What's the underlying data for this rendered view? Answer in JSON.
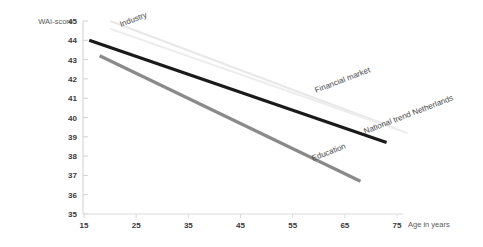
{
  "chart_data": {
    "type": "line",
    "title": "",
    "xlabel": "Age in years",
    "ylabel": "WAI-score",
    "xlim": [
      15,
      75
    ],
    "ylim": [
      35,
      45
    ],
    "grid": false,
    "legend_position": "inline-labels",
    "xticks": [
      "15",
      "25",
      "35",
      "45",
      "55",
      "65",
      "75"
    ],
    "xtick_values": [
      15,
      25,
      35,
      45,
      55,
      65,
      75
    ],
    "yticks": [
      "35",
      "36",
      "37",
      "38",
      "39",
      "40",
      "41",
      "42",
      "43",
      "44",
      "45"
    ],
    "ytick_values": [
      35,
      36,
      37,
      38,
      39,
      40,
      41,
      42,
      43,
      44,
      45
    ],
    "series": [
      {
        "name": "Industry",
        "color": "#e8e8e8",
        "width": 2.2,
        "x": [
          20,
          75
        ],
        "values": [
          45.0,
          39.4
        ]
      },
      {
        "name": "Financial market",
        "color": "#ededed",
        "width": 2.2,
        "x": [
          20,
          77
        ],
        "values": [
          44.6,
          39.2
        ]
      },
      {
        "name": "National trend Netherlands",
        "color": "#1a1a1a",
        "width": 3.2,
        "x": [
          16,
          73
        ],
        "values": [
          44.0,
          38.7
        ]
      },
      {
        "name": "Education",
        "color": "#8a8a8a",
        "width": 3.2,
        "x": [
          18,
          68
        ],
        "values": [
          43.2,
          36.7
        ]
      }
    ],
    "annotations": [
      {
        "text": "Industry",
        "x": 121,
        "y": 27,
        "rotate": -21
      },
      {
        "text": "Financial market",
        "x": 316,
        "y": 93,
        "rotate": -21
      },
      {
        "text": "National trend Netherlands",
        "x": 365,
        "y": 134,
        "rotate": -21
      },
      {
        "text": "Education",
        "x": 313,
        "y": 161,
        "rotate": -21
      }
    ]
  },
  "axes": {
    "y_axis_title": "WAI-score",
    "x_axis_title": "Age in years"
  }
}
